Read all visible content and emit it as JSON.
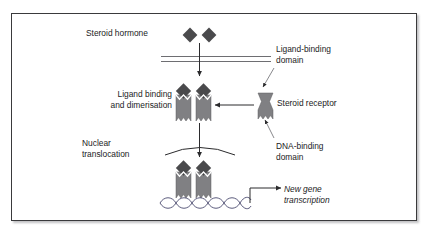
{
  "figure": {
    "background_color": "#ffffff",
    "frame_color": "#3a3a3c"
  },
  "colors": {
    "ligand_fill": "#4a4a4c",
    "receptor_fill": "#808083",
    "receptor_stroke": "#58585b",
    "line": "#2b2b2d",
    "text": "#1b1b1d",
    "membrane": "#6e6e72",
    "dna": "#4a4a6e"
  },
  "labels": {
    "steroid_hormone": "Steroid hormone",
    "ligand_binding_and_dimerisation": "Ligand binding\nand dimerisation",
    "nuclear_translocation": "Nuclear\ntranslocation",
    "ligand_binding_domain": "Ligand-binding\ndomain",
    "steroid_receptor": "Steroid receptor",
    "dna_binding_domain": "DNA-binding\ndomain",
    "new_gene_transcription": "New gene\ntranscription"
  },
  "elements": {
    "ligands": [
      {
        "name": "hormone-ligand-left",
        "cx": 190,
        "cy": 35
      },
      {
        "name": "hormone-ligand-right",
        "cx": 209,
        "cy": 35
      }
    ],
    "membrane": {
      "name": "plasma-membrane",
      "x1": 161,
      "y1": 56,
      "x2": 271,
      "y2": 62
    },
    "nuclear_envelope": {
      "name": "nuclear-envelope-arc"
    },
    "receptors": [
      {
        "name": "receptor-dimer-cytoplasm-left",
        "x": 175,
        "y": 86
      },
      {
        "name": "receptor-dimer-cytoplasm-right",
        "x": 195,
        "y": 86
      },
      {
        "name": "receptor-free",
        "x": 256,
        "y": 93
      },
      {
        "name": "receptor-dimer-nucleus-left",
        "x": 175,
        "y": 164
      },
      {
        "name": "receptor-dimer-nucleus-right",
        "x": 195,
        "y": 164
      }
    ],
    "dna": {
      "name": "dna-double-helix",
      "x": 160,
      "y": 200,
      "width": 86
    },
    "arrows": [
      {
        "name": "arrow-hormone-entry",
        "type": "vertical-down"
      },
      {
        "name": "arrow-receptor-recruitment",
        "type": "horizontal-left"
      },
      {
        "name": "arrow-nuclear-translocation",
        "type": "vertical-down"
      },
      {
        "name": "arrow-transcription",
        "type": "elbow-right"
      },
      {
        "name": "pointer-ligand-binding-domain",
        "type": "thin-pointer"
      },
      {
        "name": "pointer-dna-binding-domain",
        "type": "thin-pointer"
      }
    ]
  }
}
